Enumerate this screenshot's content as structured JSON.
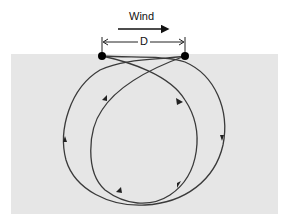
{
  "diagram": {
    "wind_label": "Wind",
    "distance_label": "D",
    "colors": {
      "background_box": "#e6e6e6",
      "line": "#3a3a3a",
      "dot": "#000000"
    }
  }
}
